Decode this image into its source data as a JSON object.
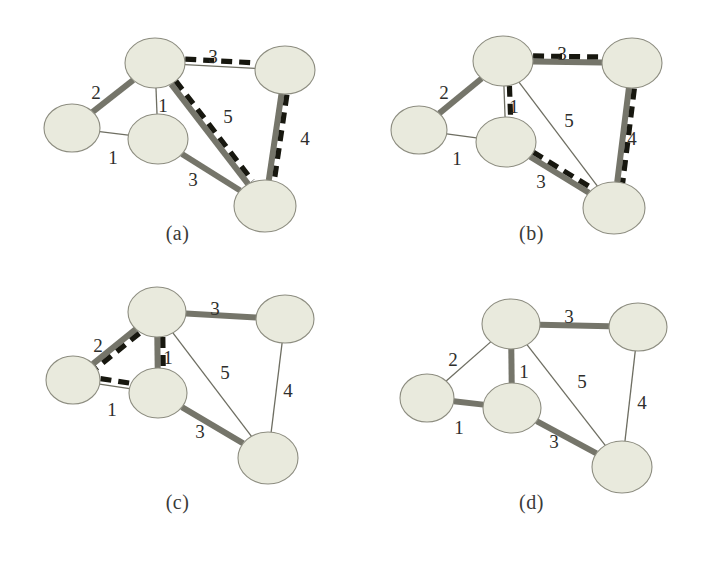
{
  "figure": {
    "background_color": "#ffffff",
    "node_fill": "#e9eadd",
    "node_stroke": "#8d8d80",
    "thin_edge_color": "#6e6e62",
    "thick_edge_color": "#75756a",
    "dashed_edge_color": "#17170f",
    "label_color": "#2e2e2c"
  },
  "panels": [
    {
      "id": "a",
      "caption": "(a)",
      "nodes": [
        {
          "id": "top",
          "cx": 155,
          "cy": 63,
          "rx": 30,
          "ry": 25
        },
        {
          "id": "left",
          "cx": 72,
          "cy": 128,
          "rx": 28,
          "ry": 24
        },
        {
          "id": "mid",
          "cx": 158,
          "cy": 139,
          "rx": 30,
          "ry": 25
        },
        {
          "id": "tright",
          "cx": 285,
          "cy": 70,
          "rx": 30,
          "ry": 24
        },
        {
          "id": "bright",
          "cx": 265,
          "cy": 206,
          "rx": 31,
          "ry": 26
        }
      ],
      "edges": [
        {
          "from": "top",
          "to": "left",
          "weight": "2",
          "style": "thick",
          "dashed": false,
          "label_x": 96,
          "label_y": 99
        },
        {
          "from": "top",
          "to": "mid",
          "weight": "1",
          "style": "thin",
          "dashed": false,
          "label_x": 163,
          "label_y": 112
        },
        {
          "from": "left",
          "to": "mid",
          "weight": "1",
          "style": "thin",
          "dashed": false,
          "label_x": 113,
          "label_y": 164
        },
        {
          "from": "top",
          "to": "tright",
          "weight": "3",
          "style": "thin",
          "dashed": true,
          "label_x": 213,
          "label_y": 63
        },
        {
          "from": "top",
          "to": "bright",
          "weight": "5",
          "style": "thick",
          "dashed": true,
          "label_x": 228,
          "label_y": 123
        },
        {
          "from": "mid",
          "to": "bright",
          "weight": "3",
          "style": "thick",
          "dashed": false,
          "label_x": 193,
          "label_y": 186
        },
        {
          "from": "tright",
          "to": "bright",
          "weight": "4",
          "style": "thick",
          "dashed": true,
          "label_x": 305,
          "label_y": 145
        }
      ],
      "highlight_cycle": [
        "top",
        "tright",
        "bright"
      ]
    },
    {
      "id": "b",
      "caption": "(b)",
      "nodes": [
        {
          "id": "top",
          "cx": 149,
          "cy": 61,
          "rx": 30,
          "ry": 25
        },
        {
          "id": "left",
          "cx": 65,
          "cy": 130,
          "rx": 28,
          "ry": 24
        },
        {
          "id": "mid",
          "cx": 152,
          "cy": 142,
          "rx": 30,
          "ry": 25
        },
        {
          "id": "tright",
          "cx": 278,
          "cy": 63,
          "rx": 30,
          "ry": 25
        },
        {
          "id": "bright",
          "cx": 260,
          "cy": 208,
          "rx": 31,
          "ry": 26
        }
      ],
      "edges": [
        {
          "from": "top",
          "to": "left",
          "weight": "2",
          "style": "thick",
          "dashed": false,
          "label_x": 90,
          "label_y": 99
        },
        {
          "from": "top",
          "to": "mid",
          "weight": "1",
          "style": "thin",
          "dashed": true,
          "label_x": 160,
          "label_y": 113
        },
        {
          "from": "left",
          "to": "mid",
          "weight": "1",
          "style": "thin",
          "dashed": false,
          "label_x": 103,
          "label_y": 165
        },
        {
          "from": "top",
          "to": "tright",
          "weight": "3",
          "style": "thick",
          "dashed": true,
          "label_x": 208,
          "label_y": 60
        },
        {
          "from": "top",
          "to": "bright",
          "weight": "5",
          "style": "thin",
          "dashed": false,
          "label_x": 215,
          "label_y": 127
        },
        {
          "from": "mid",
          "to": "bright",
          "weight": "3",
          "style": "thick",
          "dashed": true,
          "label_x": 187,
          "label_y": 188
        },
        {
          "from": "tright",
          "to": "bright",
          "weight": "4",
          "style": "thick",
          "dashed": true,
          "label_x": 278,
          "label_y": 145
        }
      ],
      "highlight_cycle": [
        "top",
        "tright",
        "bright",
        "mid"
      ]
    },
    {
      "id": "c",
      "caption": "(c)",
      "nodes": [
        {
          "id": "top",
          "cx": 157,
          "cy": 37,
          "rx": 29,
          "ry": 25
        },
        {
          "id": "left",
          "cx": 73,
          "cy": 105,
          "rx": 27,
          "ry": 24
        },
        {
          "id": "mid",
          "cx": 158,
          "cy": 118,
          "rx": 29,
          "ry": 25
        },
        {
          "id": "tright",
          "cx": 285,
          "cy": 44,
          "rx": 29,
          "ry": 24
        },
        {
          "id": "bright",
          "cx": 268,
          "cy": 183,
          "rx": 30,
          "ry": 26
        }
      ],
      "edges": [
        {
          "from": "top",
          "to": "left",
          "weight": "2",
          "style": "thick",
          "dashed": true,
          "label_x": 98,
          "label_y": 77
        },
        {
          "from": "top",
          "to": "mid",
          "weight": "1",
          "style": "thick",
          "dashed": true,
          "label_x": 168,
          "label_y": 89
        },
        {
          "from": "left",
          "to": "mid",
          "weight": "1",
          "style": "thin",
          "dashed": true,
          "label_x": 112,
          "label_y": 141
        },
        {
          "from": "top",
          "to": "tright",
          "weight": "3",
          "style": "thick",
          "dashed": false,
          "label_x": 215,
          "label_y": 40
        },
        {
          "from": "top",
          "to": "bright",
          "weight": "5",
          "style": "thin",
          "dashed": false,
          "label_x": 225,
          "label_y": 104
        },
        {
          "from": "mid",
          "to": "bright",
          "weight": "3",
          "style": "thick",
          "dashed": false,
          "label_x": 200,
          "label_y": 163
        },
        {
          "from": "tright",
          "to": "bright",
          "weight": "4",
          "style": "thin",
          "dashed": false,
          "label_x": 288,
          "label_y": 122
        }
      ],
      "highlight_cycle": [
        "top",
        "left",
        "mid"
      ]
    },
    {
      "id": "d",
      "caption": "(d)",
      "nodes": [
        {
          "id": "top",
          "cx": 157,
          "cy": 49,
          "rx": 29,
          "ry": 25
        },
        {
          "id": "left",
          "cx": 73,
          "cy": 123,
          "rx": 27,
          "ry": 24
        },
        {
          "id": "mid",
          "cx": 158,
          "cy": 133,
          "rx": 29,
          "ry": 25
        },
        {
          "id": "tright",
          "cx": 284,
          "cy": 52,
          "rx": 29,
          "ry": 24
        },
        {
          "id": "bright",
          "cx": 268,
          "cy": 192,
          "rx": 30,
          "ry": 26
        }
      ],
      "edges": [
        {
          "from": "top",
          "to": "left",
          "weight": "2",
          "style": "thin",
          "dashed": false,
          "label_x": 99,
          "label_y": 91
        },
        {
          "from": "top",
          "to": "mid",
          "weight": "1",
          "style": "thick",
          "dashed": false,
          "label_x": 170,
          "label_y": 103
        },
        {
          "from": "left",
          "to": "mid",
          "weight": "1",
          "style": "thick",
          "dashed": false,
          "label_x": 105,
          "label_y": 159
        },
        {
          "from": "top",
          "to": "tright",
          "weight": "3",
          "style": "thick",
          "dashed": false,
          "label_x": 215,
          "label_y": 48
        },
        {
          "from": "top",
          "to": "bright",
          "weight": "5",
          "style": "thin",
          "dashed": false,
          "label_x": 228,
          "label_y": 113
        },
        {
          "from": "mid",
          "to": "bright",
          "weight": "3",
          "style": "thick",
          "dashed": false,
          "label_x": 200,
          "label_y": 173
        },
        {
          "from": "tright",
          "to": "bright",
          "weight": "4",
          "style": "thin",
          "dashed": false,
          "label_x": 288,
          "label_y": 134
        }
      ],
      "highlight_cycle": []
    }
  ]
}
